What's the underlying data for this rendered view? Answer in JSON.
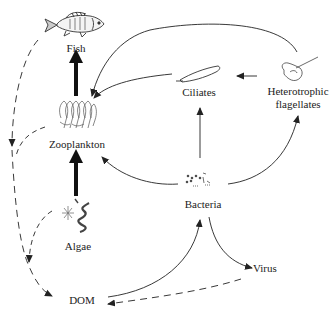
{
  "diagram": {
    "type": "food-web",
    "nodes": {
      "fish": {
        "label": "Fish"
      },
      "zooplankton": {
        "label": "Zooplankton"
      },
      "algae": {
        "label": "Algae"
      },
      "dom": {
        "label": "DOM"
      },
      "bacteria": {
        "label": "Bacteria"
      },
      "virus": {
        "label": "Virus"
      },
      "ciliates": {
        "label": "Ciliates"
      },
      "heterotrophic_flagellates": {
        "label_line1": "Heterotrophic",
        "label_line2": "flagellates"
      }
    },
    "edges": [
      {
        "from": "Zooplankton",
        "to": "Fish",
        "style": "thick-solid"
      },
      {
        "from": "Algae",
        "to": "Zooplankton",
        "style": "thick-solid"
      },
      {
        "from": "Ciliates",
        "to": "Zooplankton",
        "style": "solid"
      },
      {
        "from": "Heterotrophic flagellates",
        "to": "Zooplankton",
        "style": "solid"
      },
      {
        "from": "Heterotrophic flagellates",
        "to": "Ciliates",
        "style": "solid"
      },
      {
        "from": "Bacteria",
        "to": "Ciliates",
        "style": "solid"
      },
      {
        "from": "Bacteria",
        "to": "Heterotrophic flagellates",
        "style": "solid"
      },
      {
        "from": "Bacteria",
        "to": "Zooplankton",
        "style": "solid"
      },
      {
        "from": "DOM",
        "to": "Bacteria",
        "style": "solid"
      },
      {
        "from": "Bacteria",
        "to": "Virus",
        "style": "solid"
      },
      {
        "from": "Virus",
        "to": "DOM",
        "style": "dashed"
      },
      {
        "from": "Fish",
        "to": "DOM",
        "style": "dashed"
      },
      {
        "from": "Zooplankton",
        "to": "DOM",
        "style": "dashed"
      },
      {
        "from": "Algae",
        "to": "DOM",
        "style": "dashed"
      }
    ],
    "colors": {
      "line": "#222222",
      "illustration": "#444444"
    }
  }
}
